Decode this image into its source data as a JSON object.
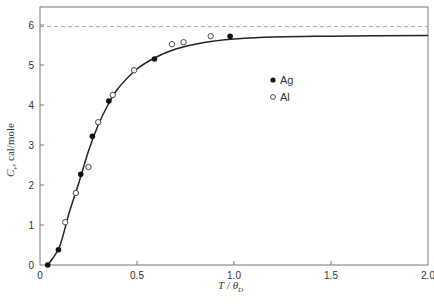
{
  "chart_data": {
    "type": "scatter",
    "title": "",
    "xlabel": "T / θ_D",
    "ylabel": "C_v, cal/mole",
    "xlim": [
      0,
      2.0
    ],
    "ylim": [
      0,
      6.45
    ],
    "xticks": [
      0,
      0.5,
      1.0,
      1.5,
      2.0
    ],
    "xtick_labels": [
      "0",
      "0.5",
      "1.0",
      "1.5",
      "2.0"
    ],
    "yticks": [
      0,
      1,
      2,
      3,
      4,
      5,
      6
    ],
    "ytick_labels": [
      "0",
      "1",
      "2",
      "3",
      "4",
      "5",
      "6"
    ],
    "grid": false,
    "legend_position": "inside-right",
    "reference_line": {
      "y": 5.96,
      "style": "dashed",
      "label": "3R limit"
    },
    "series": [
      {
        "name": "Ag",
        "marker": "filled-circle",
        "x": [
          0.04,
          0.095,
          0.21,
          0.27,
          0.355,
          0.59,
          0.98
        ],
        "y": [
          0.0,
          0.38,
          2.27,
          3.22,
          4.1,
          5.15,
          5.72
        ]
      },
      {
        "name": "Al",
        "marker": "open-circle",
        "x": [
          0.13,
          0.185,
          0.25,
          0.3,
          0.375,
          0.485,
          0.68,
          0.74,
          0.88
        ],
        "y": [
          1.07,
          1.8,
          2.45,
          3.57,
          4.25,
          4.87,
          5.52,
          5.57,
          5.72
        ]
      },
      {
        "name": "Debye curve",
        "marker": "line",
        "x": [
          0.04,
          0.1,
          0.15,
          0.2,
          0.25,
          0.3,
          0.35,
          0.4,
          0.5,
          0.6,
          0.7,
          0.8,
          0.9,
          1.0,
          1.2,
          1.5,
          2.0
        ],
        "y": [
          0.0,
          0.45,
          1.3,
          2.05,
          2.85,
          3.5,
          4.0,
          4.4,
          4.9,
          5.2,
          5.4,
          5.52,
          5.6,
          5.65,
          5.7,
          5.72,
          5.74
        ]
      }
    ]
  },
  "legend": {
    "items": [
      {
        "label": "Ag",
        "marker": "filled-circle"
      },
      {
        "label": "Al",
        "marker": "open-circle"
      }
    ]
  },
  "axes": {
    "xlabel_T": "T",
    "xlabel_sep": " / ",
    "xlabel_theta": "θ",
    "xlabel_sub": "D",
    "ylabel_C": "C",
    "ylabel_sub": "v",
    "ylabel_rest": ", cal/mole"
  }
}
